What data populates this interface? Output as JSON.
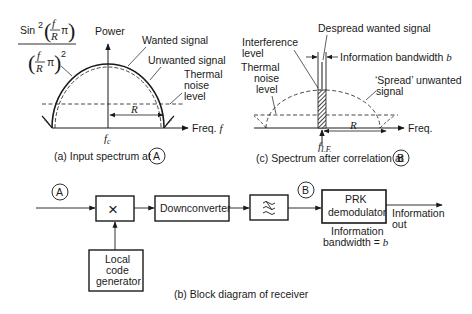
{
  "panel_a": {
    "formula": {
      "sin": "Sin",
      "sup2": "2",
      "f": "f",
      "R": "R",
      "pi": "π"
    },
    "labels": {
      "power": "Power",
      "wanted": "Wanted signal",
      "unwanted": "Unwanted signal",
      "thermal1": "Thermal",
      "thermal2": "noise",
      "thermal3": "level",
      "R": "R",
      "freq": "Freq. ",
      "freq_f": "f",
      "fc": "f",
      "fc_sub": "c"
    },
    "caption": "(a)  Input spectrum at",
    "caption_node": "A"
  },
  "panel_c": {
    "labels": {
      "despread": "Despread wanted signal",
      "interference1": "Interference",
      "interference2": "level",
      "info_bw": "Information bandwidth ",
      "info_bw_b": "b",
      "thermal1": "Thermal",
      "thermal2": "noise",
      "thermal3": "level",
      "spread1": "‘Spread’ unwanted",
      "spread2": "signal",
      "freq": "Freq.",
      "R": "R",
      "fif": "f",
      "fif_sub": "I.F."
    },
    "caption": "(c)  Spectrum after correlation at",
    "caption_node": "B"
  },
  "panel_b": {
    "node_a": "A",
    "node_b": "B",
    "mixer": "×",
    "downconverter": "Downconverter",
    "filter": "≈",
    "prk1": "PRK",
    "prk2": "demodulator",
    "local1": "Local",
    "local2": "code",
    "local3": "generator",
    "out1": "Information",
    "out2": "out",
    "bw1": "Information",
    "bw2": "bandwidth = ",
    "bw2_b": "b",
    "caption": "(b)  Block diagram of receiver"
  }
}
